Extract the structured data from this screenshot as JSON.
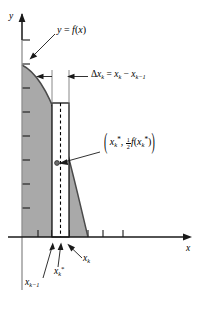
{
  "figure": {
    "background_color": "#ffffff",
    "shade_color": "#a9a9a9",
    "line_color": "#000000",
    "curve_color": "#555555"
  },
  "axes": {
    "x_axis_label": "x",
    "y_axis_label": "y",
    "x_axis_y_px": 237,
    "y_axis_x_px": 22,
    "x_ticks_px": [
      38,
      52,
      61,
      69,
      88,
      103,
      123
    ],
    "y_ticks_px": [
      40,
      64,
      88,
      112,
      136,
      160,
      184,
      208
    ]
  },
  "labels": {
    "curve": {
      "text": "y = f(x)",
      "parts": {
        "y": "y",
        "eq": "=",
        "f": "f",
        "x": "x"
      }
    },
    "delta": {
      "full": "Δx_k = x_k − x_{k−1}",
      "delta_sym": "Δ",
      "x": "x",
      "k": "k",
      "eq": "=",
      "minus": "−",
      "k_minus_1": "k−1"
    },
    "midpoint_pair": {
      "full": "( x_k*, ½ f(x_k*) )",
      "open_paren": "(",
      "close_paren": ")",
      "x": "x",
      "k": "k",
      "star": "*",
      "comma": ",",
      "frac_num": "1",
      "frac_den": "2",
      "f": "f"
    },
    "x_k_minus_1": {
      "base": "x",
      "sub": "k−1"
    },
    "x_k_star": {
      "base": "x",
      "sub": "k",
      "star": "*"
    },
    "x_k": {
      "base": "x",
      "sub": "k"
    }
  },
  "geometry": {
    "curve_start": [
      22,
      65
    ],
    "curve_end": [
      88,
      237
    ],
    "rect_left_px": 52,
    "rect_right_px": 69,
    "rect_top_px": 103,
    "rect_bottom_px": 237,
    "midline_x_px": 60,
    "midpoint_dot": [
      57,
      163
    ]
  }
}
